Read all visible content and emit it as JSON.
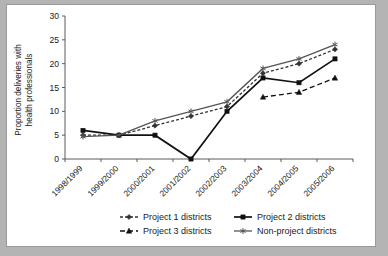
{
  "chart_data": {
    "type": "line",
    "title": "",
    "xlabel": "",
    "ylabel": "Proportion deliveries with health professionals",
    "ylabel_line1": "Proportion deliveries with",
    "ylabel_line2": "health professionals",
    "categories": [
      "1998/1999",
      "1999/2000",
      "2000/2001",
      "2001/2002",
      "2002/2003",
      "2003/2004",
      "2004/2005",
      "2005/2006"
    ],
    "ylim": [
      0,
      30
    ],
    "yticks": [
      0,
      5,
      10,
      15,
      20,
      25,
      30
    ],
    "ytick_labels": [
      "0",
      "5",
      "10",
      "15",
      "20",
      "25",
      "30"
    ],
    "grid": false,
    "legend_position": "bottom",
    "series": [
      {
        "name": "Project 1 districts",
        "marker": "diamond",
        "line_style": "dotted",
        "color": "#333333",
        "values": [
          5,
          5,
          7,
          9,
          11,
          18,
          20,
          23
        ]
      },
      {
        "name": "Project 2 districts",
        "marker": "square",
        "line_style": "solid",
        "color": "#111111",
        "values": [
          6,
          5,
          5,
          0,
          10,
          17,
          16,
          21
        ]
      },
      {
        "name": "Project 3 districts",
        "marker": "triangle",
        "line_style": "dashed",
        "color": "#111111",
        "values": [
          null,
          null,
          null,
          null,
          null,
          13,
          14,
          17
        ]
      },
      {
        "name": "Non-project districts",
        "marker": "star",
        "line_style": "solid",
        "color": "#555555",
        "values": [
          4.7,
          5,
          8,
          10,
          12,
          19,
          21,
          24
        ]
      }
    ]
  },
  "legend": {
    "items": [
      {
        "label": "Project 1 districts"
      },
      {
        "label": "Project 2 districts"
      },
      {
        "label": "Project 3 districts"
      },
      {
        "label": "Non-project districts"
      }
    ]
  }
}
